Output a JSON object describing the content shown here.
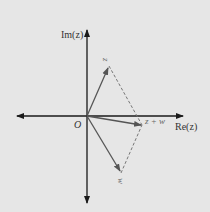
{
  "diagram": {
    "colors": {
      "background": "#e6e6e6",
      "axes": "#1a1a1a",
      "vectors": "#555555",
      "dashed": "#777777",
      "labels": "#333333",
      "vector_labels": "#666666"
    },
    "axes": {
      "x_label": "Re(z)",
      "y_label": "Im(z)",
      "origin_label": "O"
    },
    "vectors": [
      {
        "name": "z",
        "label": "z",
        "tip": [
          109,
          66
        ]
      },
      {
        "name": "w",
        "label": "w",
        "tip": [
          121,
          173
        ]
      },
      {
        "name": "z_plus_w",
        "label": "z + w",
        "tip": [
          142,
          125
        ]
      }
    ],
    "origin": [
      87,
      116
    ]
  }
}
